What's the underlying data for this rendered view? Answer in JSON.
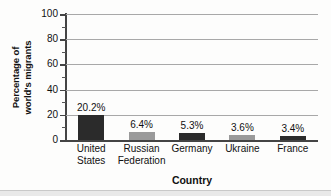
{
  "chart_data": {
    "type": "bar",
    "title": "",
    "xlabel": "Country",
    "ylabel": "Percentage of world's migrants",
    "ylabel_lines": [
      "Percentage of",
      "world's migrants"
    ],
    "categories": [
      "United States",
      "Russian Federation",
      "Germany",
      "Ukraine",
      "France"
    ],
    "category_lines": [
      [
        "United",
        "States"
      ],
      [
        "Russian",
        "Federation"
      ],
      [
        "Germany"
      ],
      [
        "Ukraine"
      ],
      [
        "France"
      ]
    ],
    "values": [
      20.2,
      6.4,
      5.3,
      3.6,
      3.4
    ],
    "value_labels": [
      "20.2%",
      "6.4%",
      "5.3%",
      "3.6%",
      "3.4%"
    ],
    "ylim": [
      0,
      100
    ],
    "ytick_labels": [
      "0",
      "20",
      "40",
      "60",
      "80",
      "100"
    ],
    "ytick_values": [
      0,
      20,
      40,
      60,
      80,
      100
    ],
    "yminor_values": [
      10,
      30,
      50,
      70,
      90
    ],
    "grid": "horizontal",
    "legend": "none",
    "bar_colors": [
      "#2b2b2b",
      "#9a9a9a",
      "#2b2b2b",
      "#9a9a9a",
      "#2b2b2b"
    ]
  }
}
